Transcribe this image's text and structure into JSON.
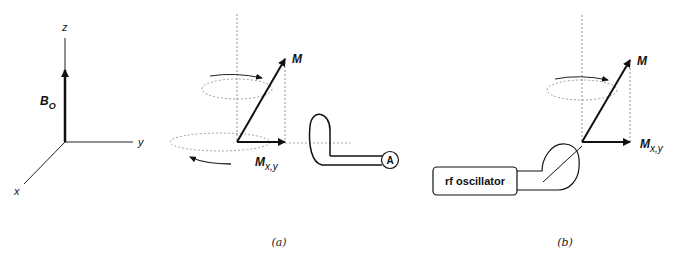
{
  "figure": {
    "axes_panel": {
      "z_label": "z",
      "y_label": "y",
      "x_label": "x",
      "field_label": "B",
      "field_subscript": "O"
    },
    "panel_a": {
      "caption": "(a)",
      "m_label": "M",
      "mxy_label": "M",
      "mxy_subscript": "x,y",
      "detector_label": "A"
    },
    "panel_b": {
      "caption": "(b)",
      "m_label": "M",
      "mxy_label": "M",
      "mxy_subscript": "x,y",
      "oscillator_label": "rf oscillator"
    }
  }
}
